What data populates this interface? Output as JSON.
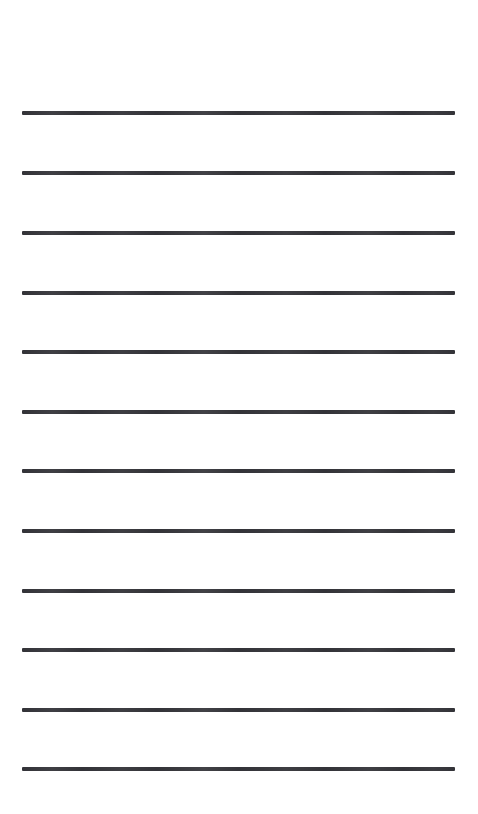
{
  "page": {
    "name": "ruled-lined-page",
    "width": 478,
    "height": 814,
    "background_color": "#ffffff",
    "content_text": ""
  },
  "lines": {
    "count": 12,
    "color": "#333338",
    "thickness_px": 4,
    "left_x": 22,
    "right_x": 455,
    "length_px": 433,
    "spacing_px": 60,
    "items": [
      {
        "index": 1,
        "y": 113,
        "label": "line-1",
        "text": ""
      },
      {
        "index": 2,
        "y": 173,
        "label": "line-2",
        "text": ""
      },
      {
        "index": 3,
        "y": 233,
        "label": "line-3",
        "text": ""
      },
      {
        "index": 4,
        "y": 293,
        "label": "line-4",
        "text": ""
      },
      {
        "index": 5,
        "y": 352,
        "label": "line-5",
        "text": ""
      },
      {
        "index": 6,
        "y": 412,
        "label": "line-6",
        "text": ""
      },
      {
        "index": 7,
        "y": 471,
        "label": "line-7",
        "text": ""
      },
      {
        "index": 8,
        "y": 531,
        "label": "line-8",
        "text": ""
      },
      {
        "index": 9,
        "y": 591,
        "label": "line-9",
        "text": ""
      },
      {
        "index": 10,
        "y": 650,
        "label": "line-10",
        "text": ""
      },
      {
        "index": 11,
        "y": 710,
        "label": "line-11",
        "text": ""
      },
      {
        "index": 12,
        "y": 769,
        "label": "line-12",
        "text": ""
      }
    ]
  }
}
